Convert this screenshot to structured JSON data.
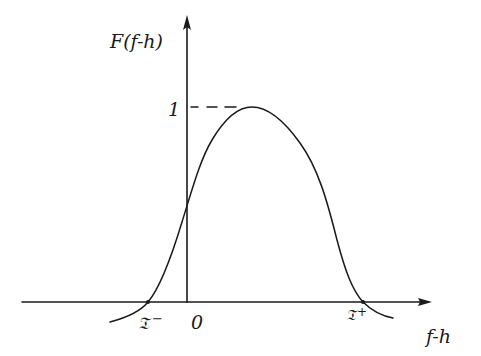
{
  "diagram": {
    "type": "hand-drawn function plot",
    "y_axis_label": "F(f-h)",
    "x_axis_label": "f-h",
    "origin_label": "0",
    "peak_level_label": "1",
    "left_root_label": "𝔗⁻",
    "right_root_label": "𝔗⁺",
    "left_root_symbol": "𝔗",
    "left_root_sup": "−",
    "right_root_symbol": "𝔗",
    "right_root_sup": "+",
    "curve_description": "Bell-shaped curve crossing x-axis at T- (negative) and T+ (positive), peaking at value 1 slightly right of the origin; dashed guide from y-axis to peak.",
    "colors": {
      "ink": "#1a1a1a",
      "background": "#ffffff"
    }
  }
}
